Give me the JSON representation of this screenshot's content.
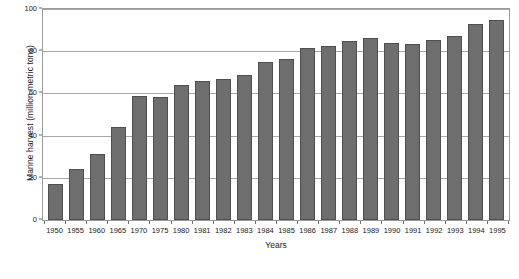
{
  "chart_data": {
    "type": "bar",
    "title": "",
    "xlabel": "Years",
    "ylabel": "Marine harvest (million metric tons)",
    "categories": [
      "1950",
      "1955",
      "1960",
      "1965",
      "1970",
      "1975",
      "1980",
      "1981",
      "1982",
      "1983",
      "1984",
      "1985",
      "1986",
      "1987",
      "1988",
      "1989",
      "1990",
      "1991",
      "1992",
      "1993",
      "1994",
      "1995"
    ],
    "values": [
      17,
      24,
      31.5,
      44,
      59,
      58.5,
      64,
      66,
      67,
      68.5,
      75,
      76.5,
      81.5,
      82.5,
      85,
      86.5,
      84,
      83.5,
      85.5,
      87,
      93,
      95
    ],
    "ylim": [
      0,
      100
    ],
    "yticks": [
      0,
      20,
      40,
      60,
      80,
      100
    ],
    "ytick_labels": [
      "0",
      "20",
      "40",
      "60",
      "80",
      "100"
    ],
    "grid": true,
    "legend": null,
    "series": [
      {
        "name": "Marine harvest",
        "color": "#6e6e6e",
        "values": [
          17,
          24,
          31.5,
          44,
          59,
          58.5,
          64,
          66,
          67,
          68.5,
          75,
          76.5,
          81.5,
          82.5,
          85,
          86.5,
          84,
          83.5,
          85.5,
          87,
          93,
          95
        ]
      }
    ]
  },
  "colors": {
    "bar_fill": "#6e6e6e",
    "bar_edge": "#4f4f4f",
    "gridline": "#a8a8a8",
    "frame": "#9a9a9a",
    "text": "#1a1a1a",
    "background": "#ffffff"
  }
}
